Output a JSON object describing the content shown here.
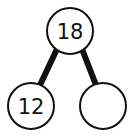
{
  "diagram": {
    "type": "number-bond",
    "whole": {
      "value": "18"
    },
    "parts": [
      {
        "value": "12"
      },
      {
        "value": ""
      }
    ]
  }
}
